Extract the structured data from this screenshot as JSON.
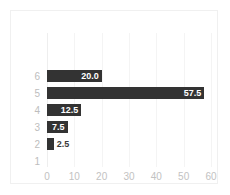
{
  "chart_data": {
    "type": "bar",
    "orientation": "horizontal",
    "title": "",
    "xlabel": "",
    "ylabel": "",
    "categories": [
      "6",
      "5",
      "4",
      "3",
      "2",
      "1"
    ],
    "values": [
      20.0,
      57.5,
      12.5,
      7.5,
      2.5,
      null
    ],
    "data_labels": [
      "20.0",
      "57.5",
      "12.5",
      "7.5",
      "2.5",
      ""
    ],
    "label_placement": [
      "inside",
      "inside",
      "inside",
      "inside",
      "outside",
      "none"
    ],
    "xlim": [
      0,
      60
    ],
    "xticks": [
      0,
      10,
      20,
      30,
      40,
      50,
      60
    ],
    "xtick_labels": [
      "0",
      "10",
      "20",
      "30",
      "40",
      "50",
      "60"
    ],
    "grid": true,
    "grid_axis": "x",
    "legend": false,
    "bar_color": "#333333",
    "label_inside_color": "#ffffff",
    "label_outside_color": "#3a3a3a",
    "tick_label_color": "#c2c2c2",
    "category_label_color": "#bdbdbd",
    "gridline_color": "#f4f4f4",
    "border_color": "#f0f0f0",
    "background": "#ffffff"
  }
}
